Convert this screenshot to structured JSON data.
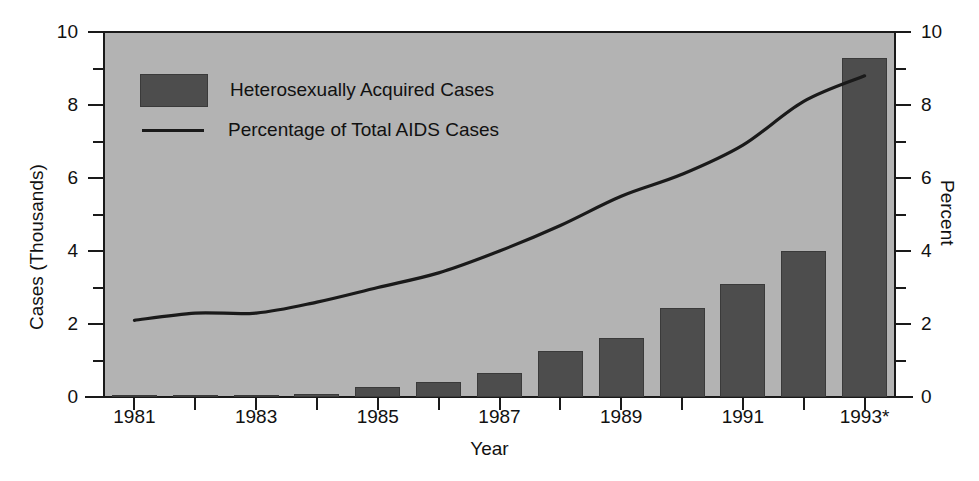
{
  "chart_data": {
    "type": "bar",
    "title": "",
    "subtitle": "",
    "xlabel": "Year",
    "ylabel": "Cases (Thousands)",
    "ylabel_right": "Percent",
    "grid": false,
    "legend_position": "upper-left",
    "ylim": [
      0,
      10
    ],
    "ylim_right": [
      0,
      10
    ],
    "y_ticks": [
      "0",
      "2",
      "4",
      "6",
      "8",
      "10"
    ],
    "y_tick_values": [
      0,
      2,
      4,
      6,
      8,
      10
    ],
    "y_minor_tick_values": [
      1,
      3,
      5,
      7,
      9
    ],
    "y_ticks_right": [
      "0",
      "2",
      "4",
      "6",
      "8",
      "10"
    ],
    "y_tick_values_right": [
      0,
      2,
      4,
      6,
      8,
      10
    ],
    "categories": [
      "1981",
      "1982",
      "1983",
      "1984",
      "1985",
      "1986",
      "1987",
      "1988",
      "1989",
      "1990",
      "1991",
      "1992",
      "1993*"
    ],
    "x_tick_labels": [
      "1981",
      "",
      "1983",
      "",
      "1985",
      "",
      "1987",
      "",
      "1989",
      "",
      "1991",
      "",
      "1993*"
    ],
    "series": [
      {
        "name": "Heterosexually Acquired Cases",
        "type": "bar",
        "axis": "left",
        "unit": "thousands",
        "color": "#4d4d4d",
        "values": [
          0.01,
          0.02,
          0.05,
          0.08,
          0.27,
          0.4,
          0.66,
          1.25,
          1.63,
          2.45,
          3.1,
          4.0,
          9.3
        ]
      },
      {
        "name": "Percentage of Total AIDS Cases",
        "type": "line",
        "axis": "right",
        "unit": "percent",
        "color": "#1a1a1a",
        "values": [
          2.1,
          2.3,
          2.3,
          2.6,
          3.0,
          3.4,
          4.0,
          4.7,
          5.5,
          6.1,
          6.9,
          8.1,
          8.8
        ]
      }
    ]
  },
  "legend": {
    "items": [
      {
        "label": "Heterosexually Acquired Cases",
        "marker": "swatch"
      },
      {
        "label": "Percentage of Total AIDS Cases",
        "marker": "line"
      }
    ]
  },
  "colors": {
    "plot_background": "#b3b3b3",
    "bar_fill": "#4d4d4d",
    "line_stroke": "#1a1a1a",
    "axis": "#1a1a1a",
    "page_background": "#ffffff"
  }
}
